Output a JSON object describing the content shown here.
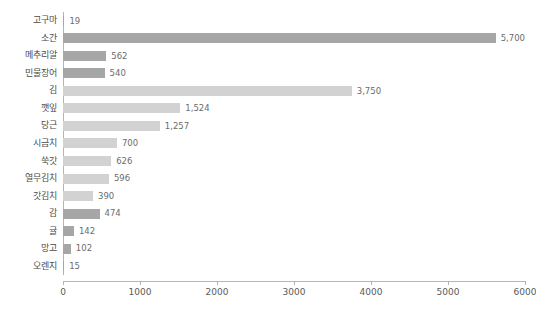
{
  "chart_data": {
    "type": "bar",
    "orientation": "horizontal",
    "title": "",
    "subtitle": "",
    "xlabel": "",
    "ylabel": "",
    "xlim": [
      0,
      6000
    ],
    "xticks": [
      "0",
      "1000",
      "2000",
      "3000",
      "4000",
      "5000",
      "6000"
    ],
    "xtick_values": [
      0,
      1000,
      2000,
      3000,
      4000,
      5000,
      6000
    ],
    "grid": false,
    "legend": null,
    "categories": [
      "고구마",
      "소간",
      "메추리알",
      "민물장어",
      "김",
      "깻잎",
      "당근",
      "시금치",
      "쑥갓",
      "열무김치",
      "갓김치",
      "감",
      "귤",
      "망고",
      "오렌지"
    ],
    "values": [
      19,
      5700,
      562,
      540,
      3750,
      1524,
      1257,
      700,
      626,
      596,
      390,
      474,
      142,
      102,
      15
    ],
    "value_labels": [
      "19",
      "5,700",
      "562",
      "540",
      "3,750",
      "1,524",
      "1,257",
      "700",
      "626",
      "596",
      "390",
      "474",
      "142",
      "102",
      "15"
    ],
    "bar_shades": [
      "dark",
      "dark",
      "dark",
      "dark",
      "light",
      "light",
      "light",
      "light",
      "light",
      "light",
      "light",
      "dark",
      "dark",
      "dark",
      "dark"
    ],
    "colors": {
      "bar_dark": "#a6a6a6",
      "bar_light": "#d2d2d2",
      "axis": "#b5b5b5",
      "category_text": "#4a4a4a",
      "value_text": "#6b6b6b",
      "tick_text": "#5a5a5a",
      "background": "#ffffff"
    }
  }
}
